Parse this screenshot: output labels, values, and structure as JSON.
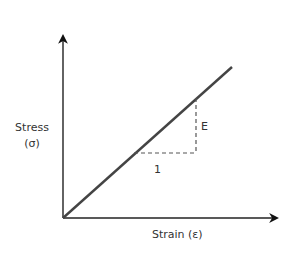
{
  "diagram": {
    "y_axis": {
      "label_line1": "Stress",
      "label_line2": "(σ)"
    },
    "x_axis": {
      "label": "Strain (ε)"
    },
    "slope_triangle": {
      "run_label": "1",
      "rise_label": "E"
    },
    "colors": {
      "axis": "#222222",
      "line": "#444444",
      "dash": "#555555",
      "text": "#333333"
    }
  }
}
